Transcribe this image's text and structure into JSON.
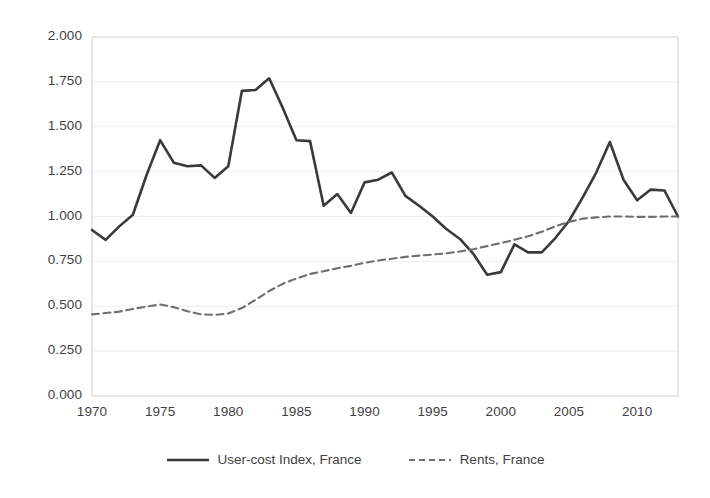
{
  "chart_data": {
    "type": "line",
    "title": "",
    "subtitle": "",
    "xlabel": "",
    "ylabel": "",
    "xlim": [
      1970,
      2013
    ],
    "ylim": [
      0.0,
      2.0
    ],
    "grid": true,
    "legend_position": "bottom",
    "ytick_labels": [
      "0.000",
      "0.250",
      "0.500",
      "0.750",
      "1.000",
      "1.250",
      "1.500",
      "1.750",
      "2.000"
    ],
    "ytick_values": [
      0.0,
      0.25,
      0.5,
      0.75,
      1.0,
      1.25,
      1.5,
      1.75,
      2.0
    ],
    "xtick_labels": [
      "1970",
      "1975",
      "1980",
      "1985",
      "1990",
      "1995",
      "2000",
      "2005",
      "2010"
    ],
    "xtick_values": [
      1970,
      1975,
      1980,
      1985,
      1990,
      1995,
      2000,
      2005,
      2010
    ],
    "x": [
      1970,
      1971,
      1972,
      1973,
      1974,
      1975,
      1976,
      1977,
      1978,
      1979,
      1980,
      1981,
      1982,
      1983,
      1984,
      1985,
      1986,
      1987,
      1988,
      1989,
      1990,
      1991,
      1992,
      1993,
      1994,
      1995,
      1996,
      1997,
      1998,
      1999,
      2000,
      2001,
      2002,
      2003,
      2004,
      2005,
      2006,
      2007,
      2008,
      2009,
      2010,
      2011,
      2012,
      2013
    ],
    "series": [
      {
        "name": "User-cost Index, France",
        "style": "solid",
        "color": "#3a3a3a",
        "values": [
          0.925,
          0.87,
          0.945,
          1.01,
          1.23,
          1.425,
          1.3,
          1.28,
          1.285,
          1.215,
          1.28,
          1.7,
          1.705,
          1.77,
          1.605,
          1.425,
          1.42,
          1.06,
          1.125,
          1.02,
          1.19,
          1.205,
          1.245,
          1.115,
          1.06,
          1.0,
          0.93,
          0.875,
          0.79,
          0.675,
          0.69,
          0.845,
          0.8,
          0.8,
          0.88,
          0.975,
          1.105,
          1.245,
          1.415,
          1.205,
          1.09,
          1.15,
          1.145,
          1.0
        ]
      },
      {
        "name": "Rents, France",
        "style": "dashed",
        "color": "#6e6e6e",
        "values": [
          0.455,
          0.462,
          0.47,
          0.485,
          0.498,
          0.51,
          0.495,
          0.472,
          0.455,
          0.452,
          0.46,
          0.49,
          0.535,
          0.585,
          0.625,
          0.655,
          0.68,
          0.695,
          0.712,
          0.725,
          0.742,
          0.755,
          0.765,
          0.775,
          0.782,
          0.788,
          0.795,
          0.805,
          0.818,
          0.835,
          0.852,
          0.87,
          0.89,
          0.915,
          0.945,
          0.97,
          0.988,
          0.995,
          1.0,
          1.0,
          0.998,
          0.998,
          1.0,
          1.0
        ]
      }
    ]
  },
  "legend": {
    "entries": [
      {
        "label": "User-cost Index, France",
        "style": "solid"
      },
      {
        "label": "Rents, France",
        "style": "dashed"
      }
    ]
  }
}
